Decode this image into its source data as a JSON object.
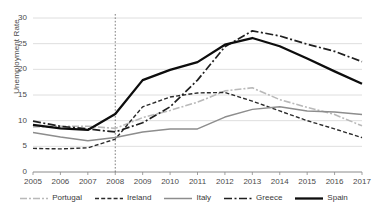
{
  "chart_data": {
    "type": "line",
    "title": "",
    "xlabel": "",
    "ylabel": "Unemployment Rate",
    "x": [
      2005,
      2006,
      2007,
      2008,
      2009,
      2010,
      2011,
      2012,
      2013,
      2014,
      2015,
      2016,
      2017
    ],
    "xtick_labels": [
      "2005",
      "2006",
      "2007",
      "2008",
      "2009",
      "2010",
      "2011",
      "2012",
      "2013",
      "2014",
      "2015",
      "2016",
      "2017"
    ],
    "ytick_labels": [
      "0",
      "5",
      "10",
      "15",
      "20",
      "25",
      "30"
    ],
    "yticks": [
      0,
      5,
      10,
      15,
      20,
      25,
      30
    ],
    "ylim": [
      0,
      30
    ],
    "xlim": [
      2005,
      2017
    ],
    "grid": "horizontal",
    "legend_position": "bottom",
    "annotations": [
      {
        "name": "crisis-reference-line",
        "type": "vline",
        "x": 2008,
        "style": "dotted"
      }
    ],
    "series": [
      {
        "name": "Portugal",
        "color": "#b9b9b9",
        "dash": "7,2,2,2",
        "width": 1.6,
        "values": [
          8.8,
          8.9,
          8.9,
          8.5,
          10.6,
          12.0,
          13.6,
          15.8,
          16.4,
          14.1,
          12.6,
          11.2,
          9.0
        ]
      },
      {
        "name": "Ireland",
        "color": "#2b2b2b",
        "dash": "4,2.2",
        "width": 1.4,
        "values": [
          4.6,
          4.5,
          4.7,
          6.4,
          12.7,
          14.6,
          15.4,
          15.5,
          13.8,
          11.9,
          10.0,
          8.4,
          6.7
        ]
      },
      {
        "name": "Italy",
        "color": "#8d8d8d",
        "dash": "none",
        "width": 1.5,
        "values": [
          7.7,
          6.8,
          6.1,
          6.7,
          7.8,
          8.4,
          8.4,
          10.7,
          12.2,
          12.7,
          11.9,
          11.7,
          11.2
        ]
      },
      {
        "name": "Greece",
        "color": "#1f1f1f",
        "dash": "8,2.5,2,2.5",
        "width": 1.7,
        "values": [
          9.9,
          8.9,
          8.4,
          7.8,
          9.6,
          12.7,
          17.9,
          24.4,
          27.5,
          26.5,
          24.9,
          23.5,
          21.5
        ]
      },
      {
        "name": "Spain",
        "color": "#0d0d0d",
        "dash": "none",
        "width": 2.3,
        "values": [
          9.2,
          8.5,
          8.2,
          11.3,
          17.9,
          19.9,
          21.4,
          24.8,
          26.1,
          24.5,
          22.1,
          19.6,
          17.2
        ]
      }
    ]
  }
}
